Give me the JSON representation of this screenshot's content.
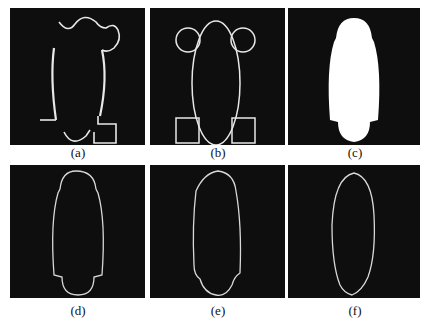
{
  "figure": {
    "panels": [
      {
        "id": "a",
        "label": "(a)",
        "description": "broken contour fragments with partial circle and square"
      },
      {
        "id": "b",
        "label": "(b)",
        "description": "ellipse with two circles on top and two squares at bottom"
      },
      {
        "id": "c",
        "label": "(c)",
        "description": "filled white merged shape"
      },
      {
        "id": "d",
        "label": "(d)",
        "description": "outline of merged shape"
      },
      {
        "id": "e",
        "label": "(e)",
        "description": "evolved smoothed contour"
      },
      {
        "id": "f",
        "label": "(f)",
        "description": "final elliptical contour"
      }
    ],
    "colors": {
      "background": "#0e0e0e",
      "stroke": "#e8e8e8",
      "fill": "#ffffff",
      "page": "#ffffff"
    }
  }
}
